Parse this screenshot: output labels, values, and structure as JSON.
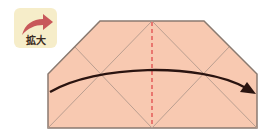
{
  "zoom_badge": {
    "label": "拡大",
    "icon": "curved-arrow-icon",
    "background": "#f6edc9",
    "arrow_color": "#c8585a"
  },
  "diagram": {
    "paper_fill": "#f8c9b1",
    "outline_color": "#8a7a70",
    "crease_color": "#b39a8c",
    "fold_line_color": "#e04c4c",
    "arrow_color": "#2a1410",
    "fold_line_style": "dashed",
    "arrow_direction": "left-to-right over center fold"
  }
}
